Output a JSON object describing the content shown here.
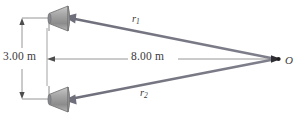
{
  "figure": {
    "kind": "physics-ray-diagram",
    "colors": {
      "ray": "#75757f",
      "dimension_line": "#8a8a8a",
      "text": "#3a3a3a",
      "speaker_body": "#9a9a9a",
      "speaker_edge": "#6e6e6e",
      "background": "#ffffff"
    }
  },
  "labels": {
    "vertical_separation": "3.00 m",
    "horizontal_distance": "8.00 m",
    "ray_top_symbol": "r",
    "ray_top_subscript": "1",
    "ray_bottom_symbol": "r",
    "ray_bottom_subscript": "2",
    "observation_point": "O"
  },
  "elements": {
    "speaker_top_name": "loudspeaker-top",
    "speaker_bottom_name": "loudspeaker-bottom",
    "vertical_dimension_name": "vertical-dimension-3m",
    "horizontal_dimension_name": "horizontal-dimension-8m",
    "ray_top_name": "ray-r1",
    "ray_bottom_name": "ray-r2",
    "point_o_name": "observation-point-o"
  },
  "geometry": {
    "speaker_top_y": 18,
    "speaker_bottom_y": 99,
    "speaker_x": 58,
    "point_o_x": 277,
    "point_o_y": 59,
    "separation_m": 3.0,
    "distance_m": 8.0
  }
}
